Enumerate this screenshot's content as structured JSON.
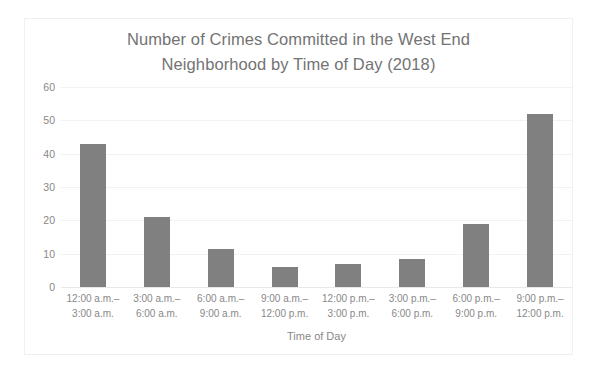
{
  "chart_data": {
    "type": "bar",
    "title": "Number of Crimes Committed in the West End Neighborhood by Time of Day (2018)",
    "title_lines": [
      "Number of Crimes Committed in the West End",
      "Neighborhood by Time of Day (2018)"
    ],
    "xlabel": "Time of Day",
    "ylabel": "Number of Crimes Committed",
    "ylim": [
      0,
      60
    ],
    "ytick_values": [
      0,
      10,
      20,
      30,
      40,
      50,
      60
    ],
    "ytick_labels": [
      "0",
      "10",
      "20",
      "30",
      "40",
      "50",
      "60"
    ],
    "grid": "horizontal",
    "legend": "none",
    "bar_color": "#808080",
    "categories": [
      "12:00 a.m.–3:00 a.m.",
      "3:00 a.m.–6:00 a.m.",
      "6:00 a.m.–9:00 a.m.",
      "9:00 a.m.–12:00 p.m.",
      "12:00 p.m.–3:00 p.m.",
      "3:00 p.m.–6:00 p.m.",
      "6:00 p.m.–9:00 p.m.",
      "9:00 p.m.–12:00 p.m."
    ],
    "category_lines": [
      [
        "12:00 a.m.–",
        "3:00 a.m."
      ],
      [
        "3:00 a.m.–",
        "6:00 a.m."
      ],
      [
        "6:00 a.m.–",
        "9:00 a.m."
      ],
      [
        "9:00 a.m.–",
        "12:00 p.m."
      ],
      [
        "12:00 p.m.–",
        "3:00 p.m."
      ],
      [
        "3:00 p.m.–",
        "6:00 p.m."
      ],
      [
        "6:00 p.m.–",
        "9:00 p.m."
      ],
      [
        "9:00 p.m.–",
        "12:00 p.m."
      ]
    ],
    "values": [
      43,
      21,
      11.5,
      6,
      7,
      8.5,
      19,
      52
    ]
  }
}
